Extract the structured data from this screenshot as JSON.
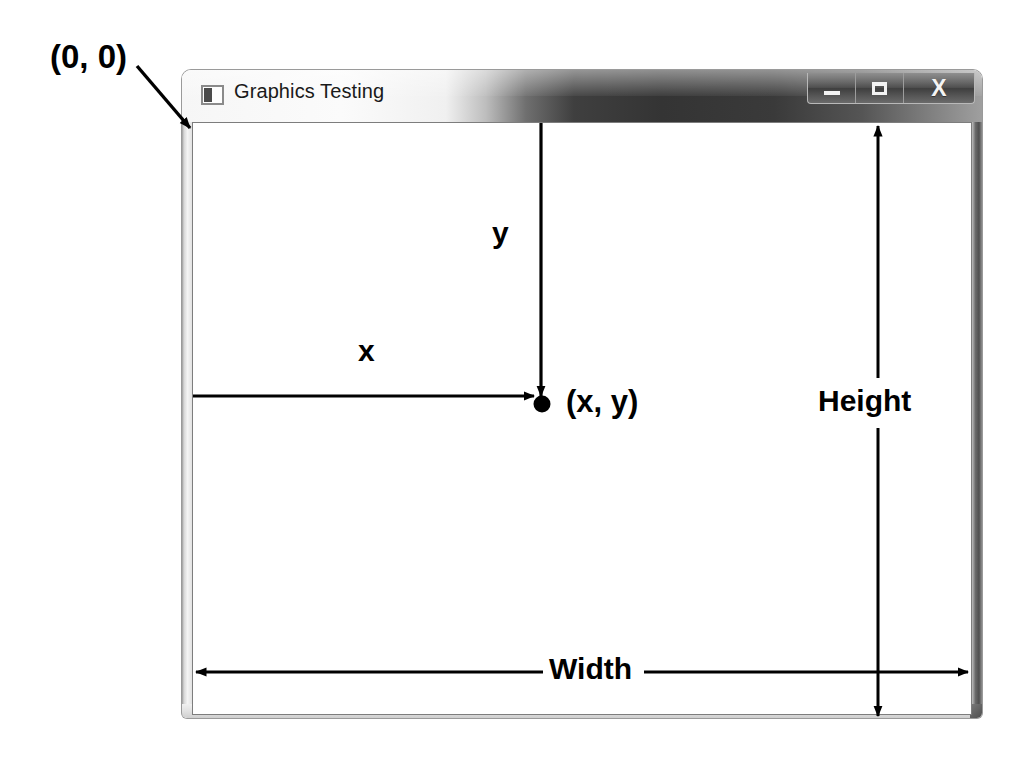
{
  "window": {
    "title": "Graphics Testing",
    "icon": "form-window-icon",
    "controls": [
      {
        "name": "minimize",
        "glyph": "–"
      },
      {
        "name": "maximize",
        "glyph": "□"
      },
      {
        "name": "close",
        "glyph": "X"
      }
    ]
  },
  "annotations": {
    "origin_label": "(0, 0)",
    "y_label": "y",
    "x_label": "x",
    "point_label": "(x, y)",
    "height_label": "Height",
    "width_label": "Width"
  },
  "colors": {
    "client_background": "#ffffff",
    "annotation_stroke": "#000000",
    "frame_light": "#f2f2f2",
    "frame_dark": "#3b3b3b",
    "title_text": "#1a1a1a"
  },
  "diagram": {
    "origin_point": [
      0,
      0
    ],
    "plotted_point": [
      359,
      281
    ],
    "client_area_px": {
      "width": 780,
      "height": 593
    }
  }
}
